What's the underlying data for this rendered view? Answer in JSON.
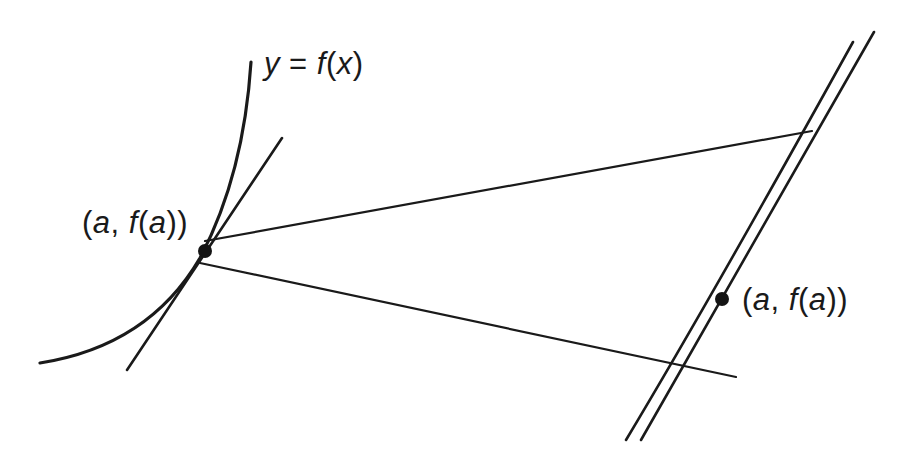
{
  "diagram": {
    "curve_label": {
      "y": "y",
      "eq": " = ",
      "f": "f",
      "open": "(",
      "x": "x",
      "close": ")"
    },
    "point_label_left": {
      "open": "(",
      "a": "a",
      "comma": ", ",
      "f": "f",
      "open2": "(",
      "a2": "a",
      "close": "))"
    },
    "point_label_right": {
      "open": "(",
      "a": "a",
      "comma": ", ",
      "f": "f",
      "open2": "(",
      "a2": "a",
      "close": "))"
    },
    "colors": {
      "stroke": "#1a1a1a",
      "background": "#ffffff"
    }
  }
}
